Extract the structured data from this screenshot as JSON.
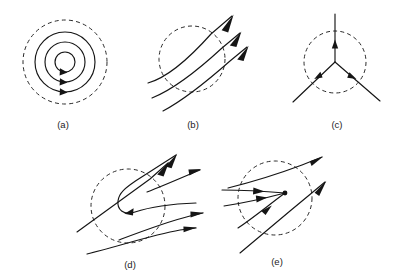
{
  "figure": {
    "background_color": "#ffffff",
    "line_color": "#151515",
    "boundary_color": "#2a2a2a",
    "width": 413,
    "height": 277,
    "cropped_header_text": "",
    "panels": [
      {
        "id": "a",
        "caption": "(a)",
        "topology": "center",
        "description": "Concentric closed streamlines (center / vortex) inside a dashed circular boundary, flow clockwise",
        "boundary": "dashed-circle",
        "center_x": 65,
        "center_y": 62,
        "boundary_radius": 42,
        "orbit_radii": [
          10,
          20,
          30
        ],
        "arrow_count": 3,
        "caption_x": 63,
        "caption_y": 125
      },
      {
        "id": "b",
        "caption": "(b)",
        "topology": "parallel-flow",
        "description": "Three nearly parallel streamlines crossing a dashed circular boundary from lower-left to upper-right",
        "boundary": "dashed-circle",
        "center_x": 192,
        "center_y": 59,
        "boundary_radius": 33,
        "streamline_count": 3,
        "arrow_count": 3,
        "caption_x": 193,
        "caption_y": 125
      },
      {
        "id": "c",
        "topology": "trisector",
        "caption": "(c)",
        "description": "Three-pronged junction with rays at 120 degrees, all arrows pointing inward to the junction point",
        "boundary": "dashed-circle",
        "center_x": 335,
        "center_y": 62,
        "boundary_radius": 31,
        "ray_count": 3,
        "arrow_count": 3,
        "caption_x": 337,
        "caption_y": 125
      },
      {
        "id": "d",
        "caption": "(d)",
        "topology": "fold-hairpin",
        "description": "Hairpin / fold: a streamline turns back on itself inside the dashed circle while neighbouring lines pass through",
        "boundary": "dashed-circle",
        "center_x": 128,
        "center_y": 206,
        "boundary_radius": 37,
        "arrow_count": 5,
        "caption_x": 130,
        "caption_y": 265
      },
      {
        "id": "e",
        "caption": "(e)",
        "topology": "convergence-node",
        "description": "Streamlines converging onto a node point inside the dashed circle, with lines passing above and through",
        "boundary": "dashed-circle",
        "center_x": 275,
        "center_y": 198,
        "boundary_radius": 37,
        "arrow_count": 5,
        "node_point_x": 285,
        "node_point_y": 193,
        "caption_x": 277,
        "caption_y": 262
      }
    ]
  }
}
